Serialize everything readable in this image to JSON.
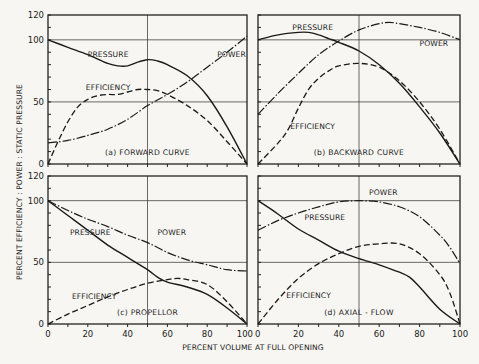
{
  "figure": {
    "ylabel": "PERCENT EFFICIENCY : POWER : STATIC PRESSURE",
    "xlabel": "PERCENT VOLUME AT FULL OPENING",
    "y_ticks": [
      "0",
      "50",
      "100",
      "120"
    ],
    "x_ticks": [
      "0",
      "20",
      "40",
      "60",
      "80",
      "100"
    ],
    "x_ticks_shared_label": "100 0"
  },
  "panels": [
    {
      "id": "a",
      "title": "(a) FORWARD CURVE",
      "labels": {
        "pressure": "PRESSURE",
        "power": "POWER",
        "efficiency": "EFFICIENCY"
      }
    },
    {
      "id": "b",
      "title": "(b) BACKWARD CURVE",
      "labels": {
        "pressure": "PRESSURE",
        "power": "POWER",
        "efficiency": "EFFICIENCY"
      }
    },
    {
      "id": "c",
      "title": "(c) PROPELLOR",
      "labels": {
        "pressure": "PRESSURE",
        "power": "POWER",
        "efficiency": "EFFICIENCY"
      }
    },
    {
      "id": "d",
      "title": "(d) AXIAL - FLOW",
      "labels": {
        "pressure": "PRESSURE",
        "power": "POWER",
        "efficiency": "EFFICIENCY"
      }
    }
  ],
  "chart_data": [
    {
      "type": "line",
      "title": "(a) FORWARD CURVE",
      "xlabel": "PERCENT VOLUME AT FULL OPENING",
      "ylabel": "PERCENT EFFICIENCY : POWER : STATIC PRESSURE",
      "xlim": [
        0,
        100
      ],
      "ylim": [
        0,
        120
      ],
      "grid": "lines at x=50, y=50, y=100",
      "series": [
        {
          "name": "PRESSURE",
          "style": "solid",
          "x": [
            0,
            10,
            20,
            30,
            35,
            40,
            45,
            50,
            55,
            60,
            70,
            80,
            90,
            100
          ],
          "y": [
            100,
            94,
            88,
            81,
            79,
            79,
            82,
            84,
            83,
            80,
            71,
            55,
            30,
            0
          ]
        },
        {
          "name": "POWER",
          "style": "dash-dot",
          "x": [
            0,
            10,
            20,
            30,
            40,
            50,
            60,
            70,
            80,
            90,
            100
          ],
          "y": [
            17,
            19,
            23,
            28,
            36,
            47,
            56,
            66,
            78,
            90,
            103
          ]
        },
        {
          "name": "EFFICIENCY",
          "style": "dashed",
          "x": [
            0,
            5,
            10,
            15,
            20,
            25,
            30,
            35,
            40,
            45,
            50,
            55,
            60,
            70,
            80,
            90,
            100
          ],
          "y": [
            0,
            18,
            34,
            46,
            52,
            55,
            56,
            56,
            58,
            60,
            60,
            59,
            56,
            47,
            35,
            18,
            0
          ]
        }
      ]
    },
    {
      "type": "line",
      "title": "(b) BACKWARD CURVE",
      "xlim": [
        0,
        100
      ],
      "ylim": [
        0,
        120
      ],
      "series": [
        {
          "name": "PRESSURE",
          "style": "solid",
          "x": [
            0,
            10,
            20,
            25,
            30,
            35,
            40,
            50,
            60,
            70,
            80,
            90,
            100
          ],
          "y": [
            100,
            104,
            106,
            106,
            104,
            101,
            98,
            91,
            80,
            65,
            46,
            25,
            0
          ]
        },
        {
          "name": "POWER",
          "style": "dash-dot",
          "x": [
            0,
            10,
            20,
            30,
            40,
            50,
            60,
            65,
            70,
            80,
            90,
            100
          ],
          "y": [
            40,
            57,
            73,
            88,
            99,
            108,
            113,
            114,
            113,
            110,
            106,
            100
          ]
        },
        {
          "name": "EFFICIENCY",
          "style": "dashed",
          "x": [
            0,
            10,
            15,
            20,
            25,
            30,
            35,
            40,
            50,
            60,
            70,
            80,
            90,
            100
          ],
          "y": [
            0,
            17,
            28,
            45,
            60,
            69,
            75,
            79,
            81,
            78,
            67,
            50,
            28,
            0
          ]
        }
      ]
    },
    {
      "type": "line",
      "title": "(c) PROPELLOR",
      "xlim": [
        0,
        100
      ],
      "ylim": [
        0,
        120
      ],
      "series": [
        {
          "name": "PRESSURE",
          "style": "solid",
          "x": [
            0,
            10,
            20,
            30,
            40,
            50,
            55,
            60,
            70,
            80,
            90,
            100
          ],
          "y": [
            100,
            88,
            76,
            64,
            54,
            44,
            38,
            34,
            30,
            24,
            13,
            0
          ]
        },
        {
          "name": "POWER",
          "style": "dash-dot",
          "x": [
            0,
            10,
            20,
            30,
            40,
            50,
            60,
            70,
            80,
            90,
            100
          ],
          "y": [
            100,
            92,
            85,
            79,
            72,
            66,
            58,
            52,
            48,
            44,
            43
          ]
        },
        {
          "name": "EFFICIENCY",
          "style": "dashed",
          "x": [
            0,
            10,
            20,
            30,
            40,
            50,
            60,
            65,
            70,
            80,
            90,
            100
          ],
          "y": [
            0,
            8,
            15,
            22,
            28,
            33,
            36,
            37,
            36,
            32,
            18,
            0
          ]
        }
      ]
    },
    {
      "type": "line",
      "title": "(d) AXIAL - FLOW",
      "xlim": [
        0,
        100
      ],
      "ylim": [
        0,
        120
      ],
      "series": [
        {
          "name": "PRESSURE",
          "style": "solid",
          "x": [
            0,
            10,
            20,
            30,
            40,
            50,
            60,
            70,
            75,
            80,
            90,
            100
          ],
          "y": [
            100,
            89,
            77,
            68,
            59,
            53,
            48,
            42,
            38,
            30,
            12,
            0
          ]
        },
        {
          "name": "POWER",
          "style": "dash-dot",
          "x": [
            0,
            10,
            20,
            30,
            40,
            50,
            60,
            70,
            80,
            90,
            95,
            100
          ],
          "y": [
            76,
            84,
            90,
            95,
            99,
            100,
            99,
            95,
            87,
            72,
            62,
            49
          ]
        },
        {
          "name": "EFFICIENCY",
          "style": "dashed",
          "x": [
            0,
            10,
            20,
            30,
            40,
            50,
            60,
            70,
            80,
            90,
            95,
            100
          ],
          "y": [
            0,
            20,
            37,
            49,
            57,
            63,
            65,
            65,
            57,
            40,
            25,
            0
          ]
        }
      ]
    }
  ]
}
